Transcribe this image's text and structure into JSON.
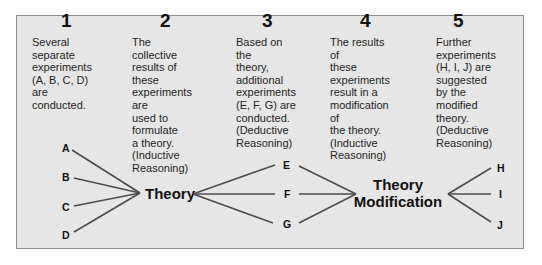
{
  "steps": [
    {
      "number": "1",
      "text": "Several separate\nexperiments\n(A, B, C, D)\nare conducted."
    },
    {
      "number": "2",
      "text": "The collective\nresults of these\nexperiments are\nused to formulate\na theory.\n(Inductive\nReasoning)"
    },
    {
      "number": "3",
      "text": "Based on the\ntheory, additional\nexperiments\n(E, F, G) are\nconducted.\n(Deductive\nReasoning)"
    },
    {
      "number": "4",
      "text": "The results of\nthese experiments\nresult in a\nmodification of\nthe theory.\n(Inductive\nReasoning)"
    },
    {
      "number": "5",
      "text": "Further\nexperiments\n(H, I, J) are\nsuggested by the\nmodified theory.\n(Deductive\nReasoning)"
    }
  ],
  "diagram": {
    "initial_experiments": [
      "A",
      "B",
      "C",
      "D"
    ],
    "theory_label": "Theory",
    "second_experiments": [
      "E",
      "F",
      "G"
    ],
    "modification_label_line1": "Theory",
    "modification_label_line2": "Modification",
    "further_experiments": [
      "H",
      "I",
      "J"
    ]
  },
  "colors": {
    "panel_background": "#e6e6e6",
    "panel_border": "#8c8c8c",
    "line_color": "#4d4d4d",
    "text_color": "#111111"
  }
}
